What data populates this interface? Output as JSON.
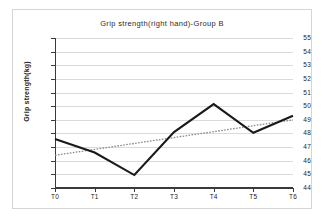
{
  "chart_data": {
    "type": "line",
    "title": "Grip strength(right hand)-Group B",
    "xlabel": "",
    "ylabel": "Grip strength(kg)",
    "categories": [
      "T0",
      "T1",
      "T2",
      "T3",
      "T4",
      "T5",
      "T6"
    ],
    "ylim": [
      44,
      55
    ],
    "yticks": [
      44,
      45,
      46,
      47,
      48,
      49,
      50,
      51,
      52,
      53,
      54,
      55
    ],
    "ytick_labels": [
      "44",
      "45",
      "46",
      "47",
      "48",
      "49",
      "50",
      "51",
      "52",
      "53",
      "54",
      "55"
    ],
    "grid": true,
    "legend": "none",
    "series": [
      {
        "name": "Grip strength (right hand)",
        "style": "solid",
        "color": "#1a1a1a",
        "values": [
          47.6,
          46.6,
          44.95,
          48.1,
          50.15,
          48.05,
          49.3
        ]
      },
      {
        "name": "Linear trend",
        "style": "dotted",
        "color": "#8a8a8a",
        "values": [
          46.4,
          46.83,
          47.27,
          47.7,
          48.13,
          48.57,
          49.0
        ]
      }
    ]
  },
  "frame": {
    "border_color": "#d5d5d5",
    "background": "#ffffff",
    "grid_color": "#dadada",
    "axis_color": "#3a3a3a"
  }
}
